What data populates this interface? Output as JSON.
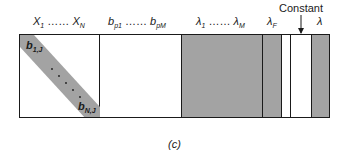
{
  "figure": {
    "caption": "(c)",
    "colors": {
      "shaded": "#a3a3a3",
      "line": "#1a1a1a",
      "background": "#ffffff"
    }
  },
  "header_labels": {
    "x_block": {
      "first": "X",
      "first_sub": "1",
      "dots": "……",
      "last": "X",
      "last_sub": "N"
    },
    "b_block": {
      "first": "b",
      "first_sub": "p1",
      "dots": "……",
      "last": "b",
      "last_sub": "pM"
    },
    "lambda_block": {
      "first": "λ",
      "first_sub": "1",
      "dots": "……",
      "last": "λ",
      "last_sub": "M"
    },
    "lambda_f": {
      "symbol": "λ",
      "sub": "F"
    },
    "constant": {
      "text": "Constant"
    },
    "lambda": {
      "symbol": "λ"
    }
  },
  "matrix": {
    "columns": [
      {
        "name": "x-block",
        "shading": "white",
        "width": 80
      },
      {
        "name": "b-block",
        "shading": "white",
        "width": 82
      },
      {
        "name": "lambda-block",
        "shading": "gray",
        "width": 81
      },
      {
        "name": "lambda-f-column",
        "shading": "gray",
        "width": 19
      },
      {
        "name": "blank-column",
        "shading": "white",
        "width": 9
      },
      {
        "name": "constant-column",
        "shading": "white",
        "width": 21
      },
      {
        "name": "lambda-column",
        "shading": "gray",
        "width": 19
      }
    ],
    "diagonal_band": {
      "top_label": {
        "symbol": "b",
        "sub": "1,J"
      },
      "bottom_label": {
        "symbol": "b",
        "sub": "N,J"
      },
      "dots": "· · · · ·"
    }
  }
}
